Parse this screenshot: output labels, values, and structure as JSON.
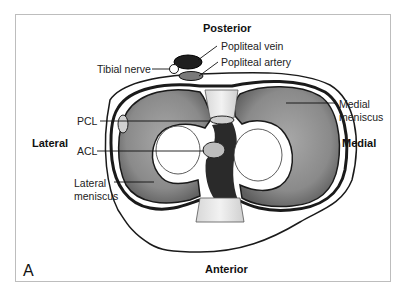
{
  "figure": {
    "panel_letter": "A",
    "orientation": {
      "top": "Posterior",
      "bottom": "Anterior",
      "left": "Lateral",
      "right": "Medial"
    },
    "labels": {
      "tibial_nerve": "Tibial nerve",
      "popliteal_vein": "Popliteal vein",
      "popliteal_artery": "Popliteal artery",
      "pcl": "PCL",
      "acl": "ACL",
      "lateral_meniscus_1": "Lateral",
      "lateral_meniscus_2": "meniscus",
      "medial_meniscus_1": "Medial",
      "medial_meniscus_2": "meniscus"
    },
    "colors": {
      "meniscus": "#8e8e8e",
      "outline": "#1a1a1a",
      "ligament": "#bdbdbd",
      "frame": "#bdbdbd"
    }
  }
}
